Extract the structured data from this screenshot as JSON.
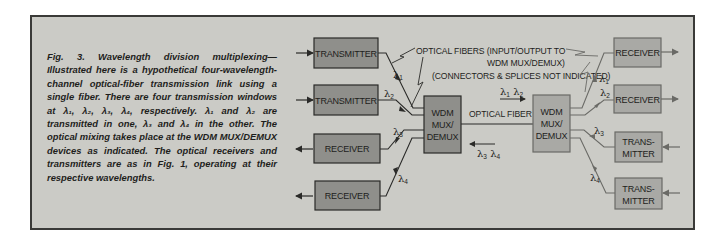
{
  "caption": {
    "label": "Fig. 3.",
    "text": "Wavelength division multiplexing—Illustrated here is a hypothetical four-wavelength-channel optical-fiber transmission link using a single fiber. There are four transmission windows at λ₁, λ₂, λ₃, λ₄, respectively. λ₁ and λ₂ are transmitted in one, λ₃ and λ₄ in the other. The optical mixing takes place at the WDM MUX/DEMUX devices as indicated. The optical receivers and transmitters are as in Fig. 1, operating at their respective wavelengths."
  },
  "annotations": {
    "fibers_line1": "OPTICAL FIBERS (INPUT/OUTPUT TO",
    "fibers_line2": "WDM MUX/DEMUX)",
    "fibers_line3": "(CONNECTORS & SPLICES NOT INDICATED)",
    "optical_fiber": "OPTICAL FIBER",
    "forward_lambdas": "λ1 λ2",
    "reverse_lambdas": "λ3 λ4"
  },
  "left_side": {
    "transmitter_1": {
      "label": "TRANSMITTER",
      "lambda": "1"
    },
    "transmitter_2": {
      "label": "TRANSMITTER",
      "lambda": "2"
    },
    "receiver_1": {
      "label": "RECEIVER",
      "lambda": "3"
    },
    "receiver_2": {
      "label": "RECEIVER",
      "lambda": "4"
    },
    "wdm": {
      "line1": "WDM",
      "line2": "MUX/",
      "line3": "DEMUX"
    }
  },
  "right_side": {
    "receiver_1": {
      "label": "RECEIVER",
      "lambda": "1"
    },
    "receiver_2": {
      "label": "RECEIVER",
      "lambda": "2"
    },
    "transmitter_1": {
      "line1": "TRANS-",
      "line2": "MITTER",
      "lambda": "3"
    },
    "transmitter_2": {
      "line1": "TRANS-",
      "line2": "MITTER",
      "lambda": "4"
    },
    "wdm": {
      "line1": "WDM",
      "line2": "MUX/",
      "line3": "DEMUX"
    }
  },
  "colors": {
    "background": "#cbcbc6",
    "left_box_fill": "#8f8f8b",
    "right_box_fill": "#a9a9a5",
    "stroke_left": "#2a2a28",
    "stroke_right": "#6a6a66"
  }
}
